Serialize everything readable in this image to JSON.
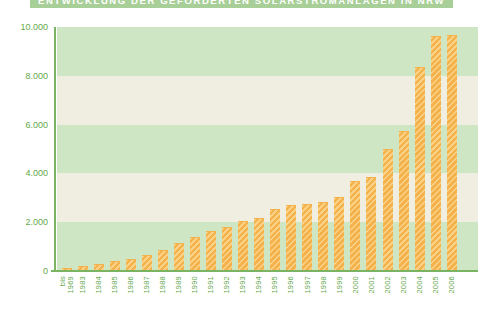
{
  "title": {
    "text": "ENTWICKLUNG DER GEFÖRDERTEN SOLARSTROMANLAGEN IN NRW",
    "note": "partially clipped at top edge of screenshot"
  },
  "chart_data": {
    "type": "bar",
    "title": "ENTWICKLUNG DER GEFÖRDERTEN SOLARSTROMANLAGEN IN NRW",
    "categories": [
      "bis 1969",
      "1983",
      "1984",
      "1985",
      "1986",
      "1987",
      "1988",
      "1989",
      "1990",
      "1991",
      "1992",
      "1993",
      "1994",
      "1995",
      "1996",
      "1997",
      "1998",
      "1999",
      "2000",
      "2001",
      "2002",
      "2003",
      "2004",
      "2005",
      "2006"
    ],
    "values": [
      100,
      150,
      250,
      350,
      450,
      600,
      800,
      1100,
      1350,
      1600,
      1750,
      2000,
      2150,
      2500,
      2650,
      2700,
      2800,
      3000,
      3650,
      3800,
      4950,
      5700,
      8300,
      9600,
      9650
    ],
    "xlabel": "",
    "ylabel": "",
    "ylim": [
      0,
      10000
    ],
    "yticks": [
      {
        "value": 0,
        "label": "0"
      },
      {
        "value": 2000,
        "label": "2.000"
      },
      {
        "value": 4000,
        "label": "4.000"
      },
      {
        "value": 6000,
        "label": "6.000"
      },
      {
        "value": 8000,
        "label": "8.000"
      },
      {
        "value": 10000,
        "label": "10.000"
      }
    ],
    "grid": "alternating horizontal bands every 2.000",
    "legend": "none",
    "bar_texture": "diagonal-hatch"
  },
  "colors": {
    "page_bg": "#ffffff",
    "title_bg": "#a8cf98",
    "title_text": "#ffffff",
    "band_green": "#cfe6c4",
    "band_cream": "#f0eee1",
    "bar_main": "#f4b24c",
    "bar_light": "#fbd186",
    "axis_green": "#7ab463",
    "tick_green": "#64a94c"
  }
}
